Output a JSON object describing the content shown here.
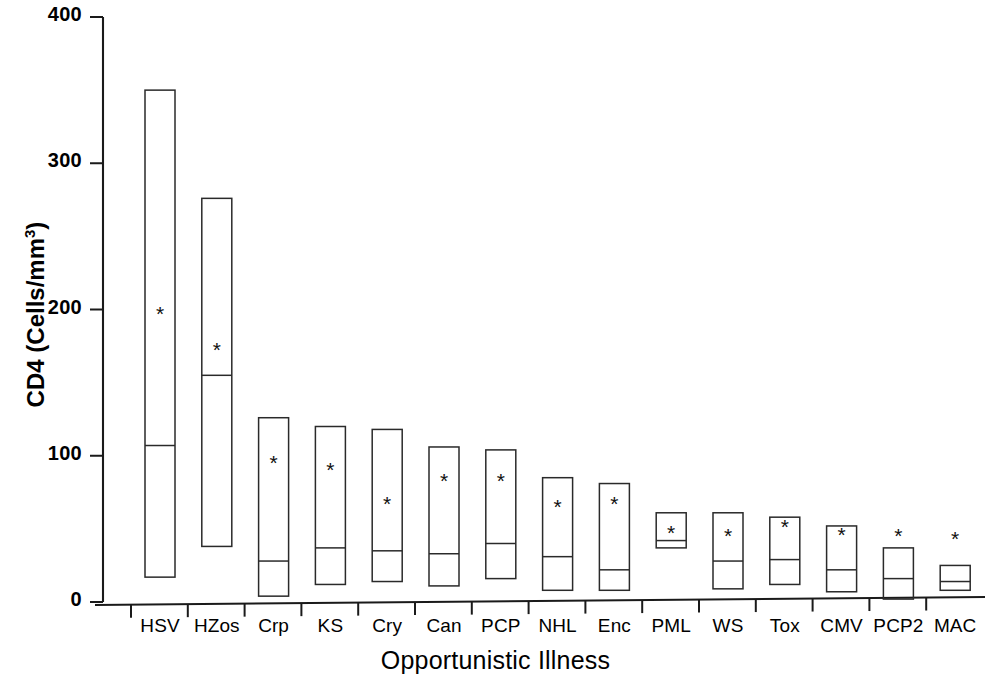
{
  "chart_data": {
    "type": "bar",
    "title": "",
    "subtitle": "",
    "xlabel": "Opportunistic Illness",
    "ylabel": "CD4 (Cells/mm3)",
    "ylabel_html": "CD4 (Cells/mm<sup>3</sup>)",
    "grid": false,
    "legend": "none",
    "ylim": [
      0,
      400
    ],
    "yticks": [
      0,
      100,
      200,
      300,
      400
    ],
    "ytick_labels": [
      "0",
      "100",
      "200",
      "300",
      "400"
    ],
    "categories": [
      "HSV",
      "HZos",
      "Crp",
      "KS",
      "Cry",
      "Can",
      "PCP",
      "NHL",
      "Enc",
      "PML",
      "WS",
      "Tox",
      "CMV",
      "PCP2",
      "MAC"
    ],
    "series": [
      {
        "name": "upper quartile",
        "values": [
          350,
          276,
          126,
          120,
          118,
          106,
          104,
          85,
          81,
          61,
          61,
          58,
          52,
          37,
          25
        ]
      },
      {
        "name": "median",
        "values": [
          107,
          155,
          28,
          37,
          35,
          33,
          40,
          31,
          22,
          42,
          28,
          29,
          22,
          16,
          14
        ]
      },
      {
        "name": "lower quartile",
        "values": [
          17,
          38,
          4,
          12,
          14,
          11,
          16,
          8,
          8,
          37,
          9,
          12,
          7,
          2,
          8
        ]
      },
      {
        "name": "mean",
        "values": [
          196,
          171,
          94,
          89,
          66,
          82,
          82,
          64,
          66,
          46,
          44,
          50,
          45,
          44,
          42
        ]
      }
    ],
    "mean_marker": "*"
  },
  "axes": {
    "x_axis_name": "opportunistic-illness-axis",
    "y_axis_name": "cd4-count-axis"
  }
}
